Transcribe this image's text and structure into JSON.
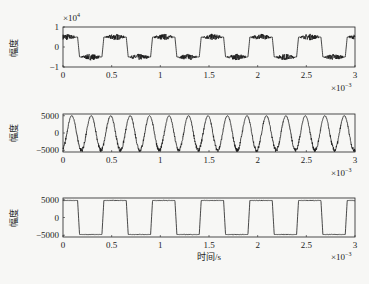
{
  "figure": {
    "background": "#f7f7f5",
    "ink": "#1a1a1a"
  },
  "chart_data": [
    {
      "type": "line",
      "title": "",
      "ylabel": "幅度",
      "xlabel": "",
      "y_multiplier": "×10^4",
      "x_multiplier": "×10^-3",
      "xlim": [
        0,
        3
      ],
      "ylim": [
        -1,
        1
      ],
      "xticks": [
        0,
        0.5,
        1,
        1.5,
        2,
        2.5,
        3
      ],
      "xtick_labels": [
        "0",
        "0.5",
        "1",
        "1.5",
        "2",
        "2.5",
        "3"
      ],
      "yticks": [
        1,
        0,
        -1
      ],
      "ytick_labels": [
        "1",
        "0",
        "−1"
      ],
      "grid": false,
      "series": [
        {
          "name": "noisy square wave (high-frequency ripple)",
          "shape": "square",
          "period": 0.5,
          "rise_edges": [
            0.4,
            0.9,
            1.4,
            1.9,
            2.4,
            2.9
          ],
          "fall_edges": [
            0.15,
            0.65,
            1.15,
            1.65,
            2.15,
            2.65
          ],
          "high": 0.5,
          "low": -0.5,
          "ripple_amplitude": 0.12
        }
      ],
      "box": {
        "x": 63,
        "y": 27,
        "w": 292,
        "h": 40
      }
    },
    {
      "type": "line",
      "title": "",
      "ylabel": "幅度",
      "xlabel": "",
      "x_multiplier": "×10^-3",
      "xlim": [
        0,
        3
      ],
      "ylim": [
        -5500,
        5500
      ],
      "xticks": [
        0,
        0.5,
        1,
        1.5,
        2,
        2.5,
        3
      ],
      "xtick_labels": [
        "0",
        "0.5",
        "1",
        "1.5",
        "2",
        "2.5",
        "3"
      ],
      "yticks": [
        5000,
        0,
        -5000
      ],
      "ytick_labels": [
        "5000",
        "0",
        "−5000"
      ],
      "grid": false,
      "series": [
        {
          "name": "sinusoid with noise bursts",
          "shape": "sine",
          "period": 0.2,
          "first_peak": 0.09,
          "amplitude": 5000,
          "noise_amplitude": 600
        }
      ],
      "box": {
        "x": 63,
        "y": 114,
        "w": 292,
        "h": 38
      }
    },
    {
      "type": "line",
      "title": "",
      "ylabel": "幅度",
      "xlabel": "时间/s",
      "x_multiplier": "×10^-3",
      "xlim": [
        0,
        3
      ],
      "ylim": [
        -5500,
        5500
      ],
      "xticks": [
        0,
        0.5,
        1,
        1.5,
        2,
        2.5,
        3
      ],
      "xtick_labels": [
        "0",
        "0.5",
        "1",
        "1.5",
        "2",
        "2.5",
        "3"
      ],
      "yticks": [
        5000,
        0,
        -5000
      ],
      "ytick_labels": [
        "5000",
        "0",
        "−5000"
      ],
      "grid": false,
      "series": [
        {
          "name": "clean square wave",
          "shape": "square",
          "period": 0.5,
          "rise_edges": [
            0.4,
            0.9,
            1.4,
            1.9,
            2.4,
            2.9
          ],
          "fall_edges": [
            0.15,
            0.65,
            1.15,
            1.65,
            2.15,
            2.65
          ],
          "high": 4800,
          "low": -4800,
          "ripple_amplitude": 80
        }
      ],
      "box": {
        "x": 63,
        "y": 198,
        "w": 292,
        "h": 39
      }
    }
  ]
}
